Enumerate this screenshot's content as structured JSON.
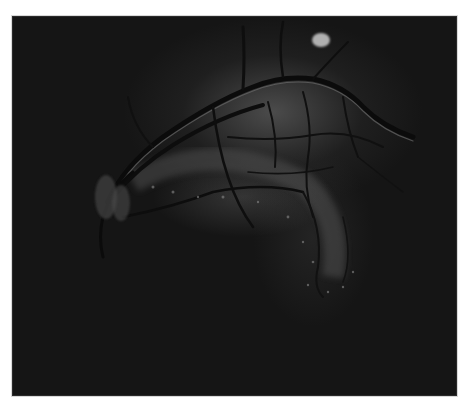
{
  "image": {
    "subject": "grayscale retinal fundus photograph",
    "frame": {
      "x": 12,
      "y": 16,
      "width": 443,
      "height": 378
    },
    "background_color": "#151515",
    "features": [
      {
        "name": "optic-disc",
        "cx": 105,
        "cy": 195,
        "rx": 12,
        "ry": 24
      },
      {
        "name": "bright-lesion",
        "cx": 320,
        "cy": 39,
        "rx": 9,
        "ry": 7
      },
      {
        "name": "vessel-arcade",
        "description": "main superior vessels from optic disc arching to upper right"
      },
      {
        "name": "inferior-exudate-band",
        "description": "bright curved band below vessels, extending down to right"
      }
    ]
  }
}
